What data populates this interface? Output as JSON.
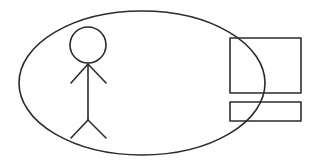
{
  "diagram": {
    "width": 316,
    "height": 164,
    "background": "#ffffff",
    "stroke_color": "#2b2b2b",
    "elements": {
      "boundary_ellipse": {
        "cx": 142,
        "cy": 83,
        "rx": 123,
        "ry": 72
      },
      "person": {
        "head": {
          "cx": 88,
          "cy": 45,
          "r": 18
        },
        "neck": {
          "x": 88,
          "y": 64
        },
        "hip": {
          "x": 88,
          "y": 120
        },
        "left_hand": {
          "x": 71,
          "y": 83
        },
        "right_hand": {
          "x": 106,
          "y": 83
        },
        "left_foot": {
          "x": 71,
          "y": 138
        },
        "right_foot": {
          "x": 106,
          "y": 138
        }
      },
      "computer": {
        "monitor": {
          "x": 230,
          "y": 38,
          "width": 71,
          "height": 55
        },
        "keyboard": {
          "x": 230,
          "y": 102,
          "width": 71,
          "height": 19
        }
      }
    }
  }
}
